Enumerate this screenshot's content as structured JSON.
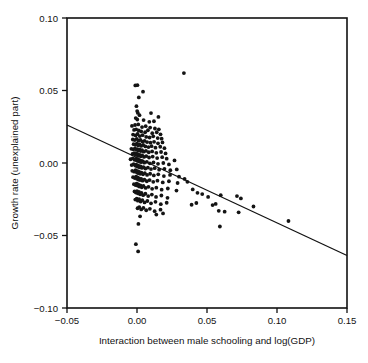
{
  "chart_data": {
    "type": "scatter",
    "title": "",
    "xlabel": "Interaction between male schooling and log(GDP)",
    "ylabel": "Growth rate (unexplained part)",
    "xlim": [
      -0.05,
      0.15
    ],
    "ylim": [
      -0.1,
      0.1
    ],
    "xticks": [
      -0.05,
      0.0,
      0.05,
      0.1,
      0.15
    ],
    "xticklabels": [
      "−0.05",
      "0.00",
      "0.05",
      "0.10",
      "0.15"
    ],
    "yticks": [
      -0.1,
      -0.05,
      0.0,
      0.05,
      0.1
    ],
    "yticklabels": [
      "−0.10",
      "−0.05",
      "0.00",
      "0.05",
      "0.10"
    ],
    "grid": false,
    "legend": false,
    "marker": "dot",
    "marker_color": "#141414",
    "marker_size": 1.9,
    "line_color": "#111111",
    "frame_color": "#111111",
    "background": "#ffffff",
    "fit_line": {
      "name": "regression line",
      "x": [
        -0.05,
        0.15
      ],
      "y": [
        0.0262,
        -0.0638
      ],
      "slope": -0.45,
      "intercept": 0.0037
    },
    "series": [
      {
        "name": "countries",
        "n_points": 214,
        "points": [
          [
            0.0335,
            0.062
          ],
          [
            -0.0012,
            0.0535
          ],
          [
            0.0003,
            0.0537
          ],
          [
            0.0043,
            0.0492
          ],
          [
            0.0013,
            0.0452
          ],
          [
            -0.0004,
            0.0392
          ],
          [
            0.0001,
            0.0358
          ],
          [
            0.0006,
            0.0345
          ],
          [
            0.0018,
            0.033
          ],
          [
            0.01,
            0.0344
          ],
          [
            0.0153,
            0.0318
          ],
          [
            -0.0009,
            0.031
          ],
          [
            0.0002,
            0.03
          ],
          [
            0.0047,
            0.0296
          ],
          [
            0.0088,
            0.0284
          ],
          [
            0.0121,
            0.0288
          ],
          [
            -0.0036,
            0.0256
          ],
          [
            -0.0014,
            0.0262
          ],
          [
            0.0009,
            0.0266
          ],
          [
            0.0036,
            0.0248
          ],
          [
            0.0062,
            0.0254
          ],
          [
            0.0094,
            0.0244
          ],
          [
            0.0128,
            0.0238
          ],
          [
            0.0156,
            0.0232
          ],
          [
            -0.0021,
            0.0228
          ],
          [
            -0.0006,
            0.0232
          ],
          [
            0.0012,
            0.0224
          ],
          [
            0.003,
            0.0218
          ],
          [
            0.0058,
            0.0212
          ],
          [
            0.0078,
            0.0226
          ],
          [
            0.0109,
            0.0206
          ],
          [
            0.0141,
            0.0212
          ],
          [
            0.0168,
            0.0198
          ],
          [
            -0.0028,
            0.0196
          ],
          [
            -0.001,
            0.019
          ],
          [
            0.0004,
            0.02
          ],
          [
            0.002,
            0.0186
          ],
          [
            0.004,
            0.0192
          ],
          [
            0.0066,
            0.018
          ],
          [
            0.009,
            0.0176
          ],
          [
            0.0116,
            0.0184
          ],
          [
            0.0148,
            0.0172
          ],
          [
            0.0176,
            0.0168
          ],
          [
            -0.003,
            0.0162
          ],
          [
            -0.0016,
            0.0158
          ],
          [
            -0.0002,
            0.0166
          ],
          [
            0.001,
            0.0154
          ],
          [
            0.0024,
            0.016
          ],
          [
            0.0038,
            0.0148
          ],
          [
            0.0054,
            0.0152
          ],
          [
            0.0072,
            0.0144
          ],
          [
            0.0096,
            0.014
          ],
          [
            0.0122,
            0.0146
          ],
          [
            0.015,
            0.0136
          ],
          [
            0.0182,
            0.0142
          ],
          [
            -0.0024,
            0.013
          ],
          [
            -0.0012,
            0.0126
          ],
          [
            -0.0001,
            0.0134
          ],
          [
            0.0008,
            0.0122
          ],
          [
            0.0018,
            0.0128
          ],
          [
            0.0029,
            0.0118
          ],
          [
            0.0044,
            0.0124
          ],
          [
            0.006,
            0.0114
          ],
          [
            0.0082,
            0.011
          ],
          [
            0.0104,
            0.0116
          ],
          [
            0.0132,
            0.0106
          ],
          [
            0.0166,
            0.0112
          ],
          [
            0.0196,
            0.0102
          ],
          [
            -0.004,
            0.0098
          ],
          [
            -0.0026,
            0.0094
          ],
          [
            -0.0014,
            0.01
          ],
          [
            -0.0004,
            0.009
          ],
          [
            0.0003,
            0.0096
          ],
          [
            0.0011,
            0.0086
          ],
          [
            0.0019,
            0.0092
          ],
          [
            0.0027,
            0.0082
          ],
          [
            0.0036,
            0.0088
          ],
          [
            0.0048,
            0.0078
          ],
          [
            0.0064,
            0.0084
          ],
          [
            0.0084,
            0.0074
          ],
          [
            0.0108,
            0.008
          ],
          [
            0.0138,
            0.007
          ],
          [
            0.0172,
            0.0076
          ],
          [
            0.0204,
            0.0066
          ],
          [
            -0.0032,
            0.0062
          ],
          [
            -0.002,
            0.0068
          ],
          [
            -0.001,
            0.0058
          ],
          [
            -0.0003,
            0.0064
          ],
          [
            0.0002,
            0.0054
          ],
          [
            0.0007,
            0.006
          ],
          [
            0.0013,
            0.005
          ],
          [
            0.002,
            0.0056
          ],
          [
            0.0028,
            0.0046
          ],
          [
            0.0037,
            0.0052
          ],
          [
            0.005,
            0.0042
          ],
          [
            0.0066,
            0.0048
          ],
          [
            0.0086,
            0.0038
          ],
          [
            0.0112,
            0.0044
          ],
          [
            0.0144,
            0.0034
          ],
          [
            0.018,
            0.004
          ],
          [
            0.0212,
            0.003
          ],
          [
            -0.0046,
            0.0026
          ],
          [
            -0.003,
            0.0032
          ],
          [
            -0.0018,
            0.0022
          ],
          [
            -0.0009,
            0.0028
          ],
          [
            -0.0002,
            0.0018
          ],
          [
            0.0002,
            0.0024
          ],
          [
            0.0006,
            0.0014
          ],
          [
            0.001,
            0.002
          ],
          [
            0.0015,
            0.001
          ],
          [
            0.0021,
            0.0016
          ],
          [
            0.0029,
            0.0006
          ],
          [
            0.0039,
            0.0012
          ],
          [
            0.0052,
            0.0002
          ],
          [
            0.007,
            0.0008
          ],
          [
            0.0092,
            -0.0002
          ],
          [
            0.0118,
            0.0004
          ],
          [
            0.015,
            -0.0006
          ],
          [
            0.0188,
            0.0
          ],
          [
            0.0228,
            -0.001
          ],
          [
            0.0268,
            0.0018
          ],
          [
            -0.0038,
            -0.0014
          ],
          [
            -0.0024,
            -0.0008
          ],
          [
            -0.0013,
            -0.0018
          ],
          [
            -0.0006,
            -0.0012
          ],
          [
            -0.0001,
            -0.0022
          ],
          [
            0.0003,
            -0.0016
          ],
          [
            0.0008,
            -0.0026
          ],
          [
            0.0013,
            -0.002
          ],
          [
            0.0019,
            -0.003
          ],
          [
            0.0026,
            -0.0024
          ],
          [
            0.0035,
            -0.0034
          ],
          [
            0.0046,
            -0.0028
          ],
          [
            0.006,
            -0.0038
          ],
          [
            0.0078,
            -0.0032
          ],
          [
            0.01,
            -0.0042
          ],
          [
            0.0126,
            -0.0036
          ],
          [
            0.0158,
            -0.0046
          ],
          [
            0.0196,
            -0.004
          ],
          [
            0.0238,
            -0.005
          ],
          [
            0.0284,
            -0.0044
          ],
          [
            -0.0034,
            -0.0054
          ],
          [
            -0.002,
            -0.006
          ],
          [
            -0.001,
            -0.005
          ],
          [
            -0.0004,
            -0.0058
          ],
          [
            0.0,
            -0.0066
          ],
          [
            0.0005,
            -0.0056
          ],
          [
            0.001,
            -0.007
          ],
          [
            0.0016,
            -0.0062
          ],
          [
            0.0023,
            -0.0074
          ],
          [
            0.0032,
            -0.0066
          ],
          [
            0.0043,
            -0.0078
          ],
          [
            0.0056,
            -0.007
          ],
          [
            0.0072,
            -0.0082
          ],
          [
            0.0094,
            -0.0074
          ],
          [
            0.012,
            -0.0086
          ],
          [
            0.0152,
            -0.0078
          ],
          [
            0.0192,
            -0.009
          ],
          [
            0.0236,
            -0.0082
          ],
          [
            0.03,
            -0.0094
          ],
          [
            0.034,
            -0.011
          ],
          [
            -0.0028,
            -0.0098
          ],
          [
            -0.0016,
            -0.0104
          ],
          [
            -0.0007,
            -0.0094
          ],
          [
            -0.0001,
            -0.0108
          ],
          [
            0.0004,
            -0.01
          ],
          [
            0.0009,
            -0.0114
          ],
          [
            0.0015,
            -0.0106
          ],
          [
            0.0022,
            -0.0118
          ],
          [
            0.003,
            -0.011
          ],
          [
            0.004,
            -0.0122
          ],
          [
            0.0053,
            -0.0114
          ],
          [
            0.007,
            -0.0126
          ],
          [
            0.009,
            -0.0118
          ],
          [
            0.0116,
            -0.013
          ],
          [
            0.0146,
            -0.0122
          ],
          [
            0.0184,
            -0.0134
          ],
          [
            0.0228,
            -0.0126
          ],
          [
            0.029,
            -0.0138
          ],
          [
            0.036,
            -0.013
          ],
          [
            -0.0022,
            -0.0146
          ],
          [
            -0.0011,
            -0.0152
          ],
          [
            -0.0003,
            -0.0142
          ],
          [
            0.0003,
            -0.0156
          ],
          [
            0.0009,
            -0.0148
          ],
          [
            0.0016,
            -0.0162
          ],
          [
            0.0024,
            -0.0154
          ],
          [
            0.0034,
            -0.0168
          ],
          [
            0.0046,
            -0.0158
          ],
          [
            0.0062,
            -0.0172
          ],
          [
            0.0082,
            -0.0164
          ],
          [
            0.0108,
            -0.0178
          ],
          [
            0.0138,
            -0.017
          ],
          [
            0.0176,
            -0.0184
          ],
          [
            0.022,
            -0.0176
          ],
          [
            0.0282,
            -0.019
          ],
          [
            0.0398,
            -0.0182
          ],
          [
            0.0432,
            -0.0206
          ],
          [
            -0.0018,
            -0.0196
          ],
          [
            -0.0008,
            -0.0204
          ],
          [
            0.0,
            -0.0194
          ],
          [
            0.0007,
            -0.021
          ],
          [
            0.0014,
            -0.02
          ],
          [
            0.0022,
            -0.0216
          ],
          [
            0.0032,
            -0.0206
          ],
          [
            0.0044,
            -0.0222
          ],
          [
            0.006,
            -0.0212
          ],
          [
            0.008,
            -0.0228
          ],
          [
            0.0106,
            -0.0218
          ],
          [
            0.0136,
            -0.0234
          ],
          [
            0.0174,
            -0.0224
          ],
          [
            0.0218,
            -0.024
          ],
          [
            0.0466,
            -0.0214
          ],
          [
            0.0508,
            -0.0234
          ],
          [
            0.0598,
            -0.0222
          ],
          [
            0.0714,
            -0.0228
          ],
          [
            0.0742,
            -0.0244
          ],
          [
            -0.0012,
            -0.0252
          ],
          [
            -0.0002,
            -0.0246
          ],
          [
            0.0006,
            -0.026
          ],
          [
            0.0015,
            -0.025
          ],
          [
            0.0026,
            -0.0266
          ],
          [
            0.0038,
            -0.0256
          ],
          [
            0.0054,
            -0.0272
          ],
          [
            0.0074,
            -0.0262
          ],
          [
            0.01,
            -0.0278
          ],
          [
            0.0132,
            -0.0268
          ],
          [
            0.017,
            -0.0284
          ],
          [
            0.0212,
            -0.0274
          ],
          [
            0.039,
            -0.0288
          ],
          [
            0.0424,
            -0.0276
          ],
          [
            0.054,
            -0.029
          ],
          [
            0.0562,
            -0.0282
          ],
          [
            0.0832,
            -0.03
          ],
          [
            0.0004,
            -0.0312
          ],
          [
            0.0016,
            -0.0304
          ],
          [
            0.003,
            -0.032
          ],
          [
            0.0046,
            -0.031
          ],
          [
            0.0066,
            -0.0326
          ],
          [
            0.0092,
            -0.0316
          ],
          [
            0.0126,
            -0.0332
          ],
          [
            0.0168,
            -0.0322
          ],
          [
            0.0584,
            -0.033
          ],
          [
            0.0626,
            -0.0336
          ],
          [
            0.0726,
            -0.034
          ],
          [
            0.0138,
            -0.0356
          ],
          [
            0.0186,
            -0.0348
          ],
          [
            0.0022,
            -0.0368
          ],
          [
            0.1082,
            -0.04
          ],
          [
            0.0592,
            -0.0438
          ],
          [
            0.001,
            -0.042
          ],
          [
            -0.0008,
            -0.056
          ],
          [
            0.0008,
            -0.061
          ]
        ]
      }
    ]
  }
}
